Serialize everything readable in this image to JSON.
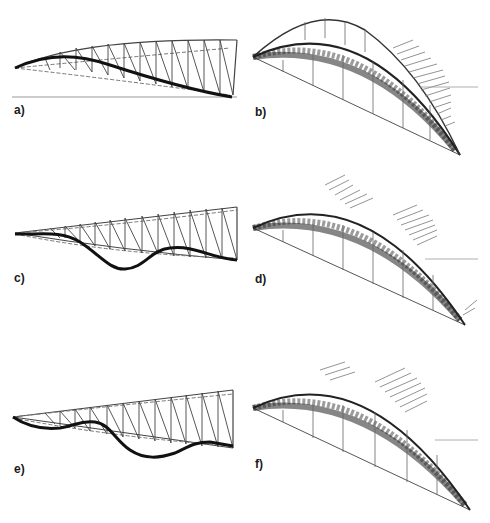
{
  "figure": {
    "colors": {
      "line": "#333333",
      "dashed": "#777777",
      "deformed": "#111111",
      "background": "#ffffff"
    },
    "panels": [
      {
        "id": "a",
        "label": "a)",
        "type": "2d-truss-elevation",
        "mode": "first mode - single smooth sag"
      },
      {
        "id": "b",
        "label": "b)",
        "type": "3d-arch-truss",
        "mode": "lateral mode vectors on right half"
      },
      {
        "id": "c",
        "label": "c)",
        "type": "2d-truss-elevation",
        "mode": "second mode - wave"
      },
      {
        "id": "d",
        "label": "d)",
        "type": "3d-arch-truss",
        "mode": "vectors near crown and right"
      },
      {
        "id": "e",
        "label": "e)",
        "type": "2d-truss-elevation",
        "mode": "third mode - double wave"
      },
      {
        "id": "f",
        "label": "f)",
        "type": "3d-arch-truss",
        "mode": "vectors near crown and mid-right"
      }
    ]
  }
}
